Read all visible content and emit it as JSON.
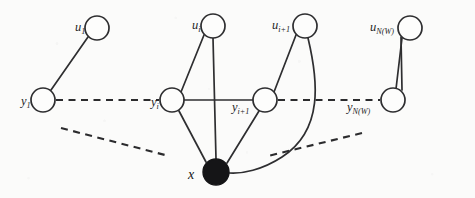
{
  "figure": {
    "background_color": "#fbfbfa",
    "ink_color": "#2e2e30",
    "filled_node_color": "#151517"
  },
  "nodes": {
    "top_row": [
      {
        "id": "u1",
        "base": "u",
        "sub": "1",
        "cx": 97,
        "cy": 28,
        "r": 12,
        "filled": false,
        "label_x": 75,
        "label_y": 30
      },
      {
        "id": "ui",
        "base": "u",
        "sub": "i",
        "cx": 213,
        "cy": 26,
        "r": 12,
        "filled": false,
        "label_x": 191,
        "label_y": 28
      },
      {
        "id": "ui1",
        "base": "u",
        "sub": "i+1",
        "cx": 305,
        "cy": 26,
        "r": 12,
        "filled": false,
        "label_x": 272,
        "label_y": 28
      },
      {
        "id": "uNW",
        "base": "u",
        "sub": "N(W)",
        "cx": 410,
        "cy": 28,
        "r": 12,
        "filled": false,
        "label_x": 371,
        "label_y": 30
      }
    ],
    "middle_row": [
      {
        "id": "y1",
        "base": "y",
        "sub": "1",
        "cx": 43,
        "cy": 100,
        "r": 12,
        "filled": false,
        "label_x": 21,
        "label_y": 105
      },
      {
        "id": "yi",
        "base": "y",
        "sub": "i",
        "cx": 172,
        "cy": 100,
        "r": 12,
        "filled": false,
        "label_x": 150,
        "label_y": 105
      },
      {
        "id": "yi1",
        "base": "y",
        "sub": "i+1",
        "cx": 265,
        "cy": 100,
        "r": 12,
        "filled": false,
        "label_x": 232,
        "label_y": 110
      },
      {
        "id": "yNW",
        "base": "y",
        "sub": "N(W)",
        "cx": 393,
        "cy": 100,
        "r": 12,
        "filled": false,
        "label_x": 348,
        "label_y": 110
      }
    ],
    "sink": {
      "id": "x",
      "base": "x",
      "sub": "",
      "cx": 216,
      "cy": 172,
      "r": 13,
      "filled": true,
      "label_x": 188,
      "label_y": 178
    }
  },
  "edges": {
    "solid": [
      {
        "name": "u1-y1",
        "from": "u1",
        "to": "y1"
      },
      {
        "name": "ui-yi",
        "from": "ui",
        "to": "yi"
      },
      {
        "name": "ui-x",
        "from": "ui",
        "to": "x"
      },
      {
        "name": "ui1-yi1",
        "from": "ui1",
        "to": "yi1"
      },
      {
        "name": "uNW-yNW",
        "from": "uNW",
        "to": "yNW"
      },
      {
        "name": "yi-yi1",
        "from": "yi",
        "to": "yi1"
      },
      {
        "name": "yi-x",
        "from": "yi",
        "to": "x"
      },
      {
        "name": "yi1-x",
        "from": "yi1",
        "to": "x"
      }
    ],
    "curved": [
      {
        "name": "ui1-x-curve",
        "from": "ui1",
        "to": "x",
        "path": "M 307 38 C 316 78, 322 128, 280 158 C 258 172, 240 174, 229 173"
      }
    ],
    "dashed": [
      {
        "name": "y1-yi-dashed",
        "from": "y1",
        "to": "yi",
        "x1": 56,
        "y1": 100,
        "x2": 159,
        "y2": 100
      },
      {
        "name": "yi1-yNW-dashed",
        "from": "yi1",
        "to": "yNW",
        "x1": 278,
        "y1": 100,
        "x2": 380,
        "y2": 100
      },
      {
        "name": "y1-x-dashed",
        "from": "y1",
        "to": "x",
        "x1": 61,
        "y1": 128,
        "x2": 165,
        "y2": 155
      },
      {
        "name": "yNW-x-dashed",
        "from": "yNW",
        "to": "x",
        "x1": 362,
        "y1": 133,
        "x2": 268,
        "y2": 156
      }
    ]
  }
}
